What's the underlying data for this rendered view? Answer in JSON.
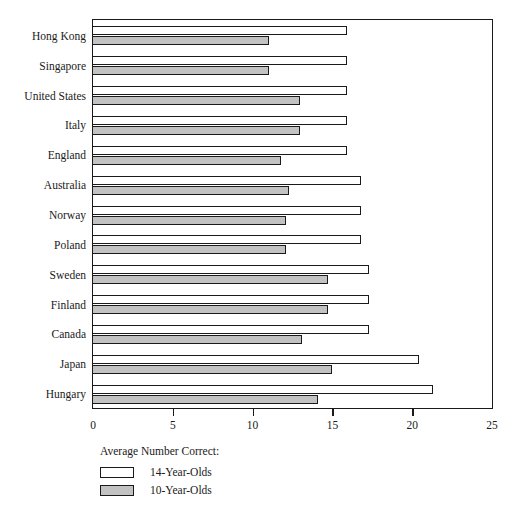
{
  "chart_data": {
    "type": "bar",
    "orientation": "horizontal",
    "title": "",
    "xlabel": "",
    "ylabel": "",
    "xlim": [
      0,
      25
    ],
    "xticks": [
      0,
      5,
      10,
      15,
      20,
      25
    ],
    "grid": false,
    "legend_position": "below-left",
    "legend_title": "Average Number Correct:",
    "categories": [
      "Hong Kong",
      "Singapore",
      "United States",
      "Italy",
      "England",
      "Australia",
      "Norway",
      "Poland",
      "Sweden",
      "Finland",
      "Canada",
      "Japan",
      "Hungary"
    ],
    "series": [
      {
        "name": "14-Year-Olds",
        "color": "#ffffff",
        "values": [
          15.9,
          15.9,
          15.9,
          15.9,
          15.9,
          16.8,
          16.8,
          16.8,
          17.3,
          17.3,
          17.3,
          20.4,
          21.3
        ]
      },
      {
        "name": "10-Year-Olds",
        "color": "#c2c2c2",
        "values": [
          11.0,
          11.0,
          13.0,
          13.0,
          11.8,
          12.3,
          12.1,
          12.1,
          14.7,
          14.7,
          13.1,
          15.0,
          14.1
        ]
      }
    ]
  },
  "axis": {
    "tick_labels": [
      "0",
      "5",
      "10",
      "15",
      "20",
      "25"
    ]
  },
  "legend": {
    "title": "Average Number Correct:",
    "items": [
      {
        "label": "14-Year-Olds",
        "swatch": "white"
      },
      {
        "label": "10-Year-Olds",
        "swatch": "gray"
      }
    ]
  },
  "caption": {
    "clipped_text": ""
  },
  "colors": {
    "ink": "#1a1a1a",
    "bar_white": "#ffffff",
    "bar_gray": "#c2c2c2",
    "background": "#ffffff"
  }
}
